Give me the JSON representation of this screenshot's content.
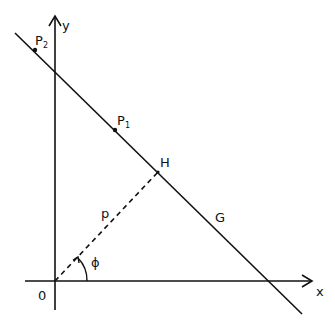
{
  "diagram": {
    "axes": {
      "x_label": "x",
      "y_label": "y",
      "origin_label": "0"
    },
    "line_label": "G",
    "foot_label": "H",
    "perp_label": "p",
    "angle_label": "ϕ",
    "points": [
      {
        "name": "P",
        "sub": "1"
      },
      {
        "name": "P",
        "sub": "2"
      }
    ],
    "colors": {
      "stroke": "#111111",
      "background": "#ffffff"
    }
  }
}
